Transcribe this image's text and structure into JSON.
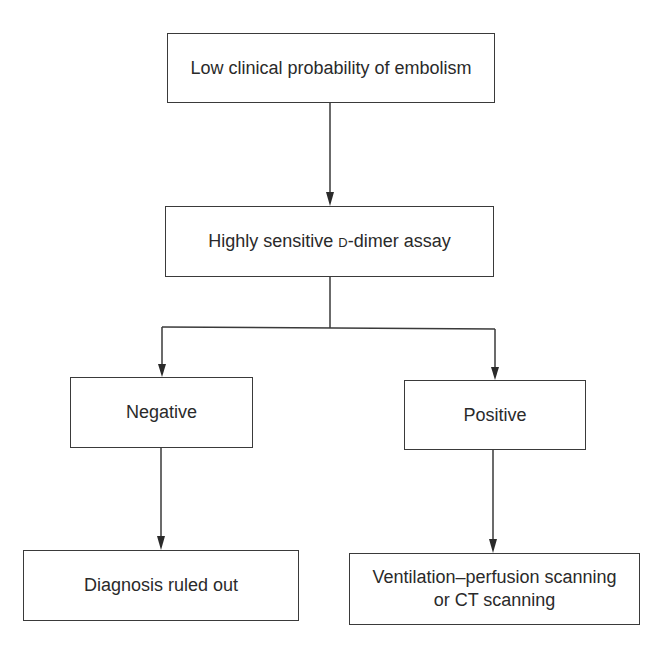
{
  "diagram": {
    "nodes": {
      "start": {
        "label": "Low clinical probability of embolism"
      },
      "assay": {
        "label_prefix": "Highly sensitive ",
        "label_smallcaps": "d",
        "label_suffix": "-dimer assay"
      },
      "negative": {
        "label": "Negative"
      },
      "positive": {
        "label": "Positive"
      },
      "ruled_out": {
        "label": "Diagnosis ruled out"
      },
      "scanning": {
        "line1": "Ventilation–perfusion scanning",
        "line2": "or CT scanning"
      }
    },
    "edges": [
      {
        "from": "start",
        "to": "assay"
      },
      {
        "from": "assay",
        "to": "negative"
      },
      {
        "from": "assay",
        "to": "positive"
      },
      {
        "from": "negative",
        "to": "ruled_out"
      },
      {
        "from": "positive",
        "to": "scanning"
      }
    ],
    "colors": {
      "line": "#3a3a3a",
      "text": "#2a2a2a",
      "background": "#ffffff"
    }
  }
}
